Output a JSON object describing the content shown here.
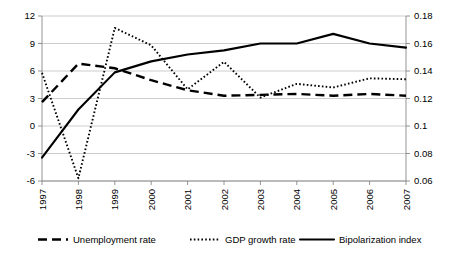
{
  "chart_data": {
    "type": "line",
    "title": "",
    "subtitle": "",
    "xlabel": "",
    "ylabel": "",
    "grid": true,
    "legend_position": "bottom",
    "categories": [
      "1997",
      "1998",
      "1999",
      "2000",
      "2001",
      "2002",
      "2003",
      "2004",
      "2005",
      "2006",
      "2007"
    ],
    "axes": {
      "left": {
        "label": "",
        "ylim": [
          -6,
          12
        ],
        "ticks": [
          "-6",
          "-3",
          "0",
          "3",
          "6",
          "9",
          "12"
        ],
        "tick_values": [
          -6,
          -3,
          0,
          3,
          6,
          9,
          12
        ]
      },
      "right": {
        "label": "",
        "ylim": [
          0.06,
          0.18
        ],
        "ticks": [
          "0.06",
          "0.08",
          "0.1",
          "0.12",
          "0.14",
          "0.16",
          "0.18"
        ],
        "tick_values": [
          0.06,
          0.08,
          0.1,
          0.12,
          0.14,
          0.16,
          0.18
        ]
      }
    },
    "series": [
      {
        "name": "Unemployment rate",
        "style": "dashed",
        "axis": "left",
        "values": [
          2.6,
          6.8,
          6.3,
          5.0,
          3.9,
          3.3,
          3.4,
          3.5,
          3.3,
          3.5,
          3.3
        ]
      },
      {
        "name": "GDP growth rate",
        "style": "dotted",
        "axis": "left",
        "values": [
          5.8,
          -5.7,
          10.7,
          8.8,
          4.0,
          7.0,
          3.1,
          4.6,
          4.2,
          5.2,
          5.1
        ]
      },
      {
        "name": "Bipolarization index",
        "style": "solid",
        "axis": "right",
        "values": [
          0.077,
          0.112,
          0.139,
          0.147,
          0.152,
          0.155,
          0.16,
          0.16,
          0.167,
          0.16,
          0.157
        ]
      }
    ]
  },
  "legend": {
    "items": [
      {
        "label": "Unemployment rate",
        "style": "dashed"
      },
      {
        "label": "GDP growth rate",
        "style": "dotted"
      },
      {
        "label": "Bipolarization index",
        "style": "solid"
      }
    ]
  }
}
